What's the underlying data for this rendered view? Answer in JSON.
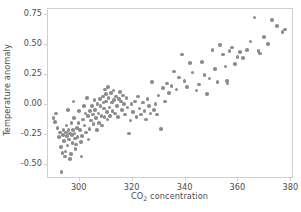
{
  "chart_data": {
    "type": "scatter",
    "title": "",
    "xlabel": "CO2 concentration",
    "xlabel_parts": {
      "pre": "CO",
      "sub": "2",
      "post": " concentration"
    },
    "ylabel": "Temperature anomaly",
    "xlim": [
      288,
      381
    ],
    "ylim": [
      -0.62,
      0.8
    ],
    "grid": false,
    "legend": null,
    "marker_color": "#8c8c8c",
    "marker_size_px": 3.6,
    "frame_color": "#cfcfcf",
    "tick_label_color": "#4d4d4d",
    "xticks": [
      300,
      320,
      340,
      360,
      380
    ],
    "xtick_labels": [
      "300",
      "320",
      "340",
      "360",
      "380"
    ],
    "yticks": [
      0.75,
      0.5,
      0.25,
      0.0,
      -0.25,
      -0.5
    ],
    "ytick_labels": [
      "0.75",
      "0.50",
      "0.25",
      "0.00",
      "-0.25",
      "-0.50"
    ],
    "series": [
      {
        "name": "observations",
        "points": [
          [
            290.5,
            -0.12
          ],
          [
            291.0,
            -0.15
          ],
          [
            291.5,
            -0.08
          ],
          [
            292.0,
            -0.2
          ],
          [
            292.5,
            -0.28
          ],
          [
            293.0,
            -0.24
          ],
          [
            293.2,
            -0.36
          ],
          [
            293.5,
            -0.57
          ],
          [
            293.8,
            -0.41
          ],
          [
            294.0,
            -0.26
          ],
          [
            294.2,
            -0.22
          ],
          [
            294.5,
            -0.31
          ],
          [
            294.8,
            -0.44
          ],
          [
            295.0,
            -0.4
          ],
          [
            295.2,
            -0.24
          ],
          [
            295.4,
            -0.18
          ],
          [
            295.6,
            -0.27
          ],
          [
            295.8,
            -0.35
          ],
          [
            296.0,
            -0.05
          ],
          [
            296.2,
            -0.22
          ],
          [
            296.4,
            -0.3
          ],
          [
            296.6,
            -0.25
          ],
          [
            296.8,
            -0.46
          ],
          [
            297.0,
            -0.42
          ],
          [
            297.2,
            -0.16
          ],
          [
            297.4,
            -0.26
          ],
          [
            297.6,
            -0.33
          ],
          [
            297.8,
            -0.22
          ],
          [
            298.0,
            0.02
          ],
          [
            298.2,
            -0.12
          ],
          [
            298.4,
            -0.25
          ],
          [
            298.6,
            -0.29
          ],
          [
            298.8,
            -0.38
          ],
          [
            299.0,
            -0.34
          ],
          [
            299.3,
            -0.2
          ],
          [
            299.6,
            -0.28
          ],
          [
            299.9,
            -0.16
          ],
          [
            300.2,
            -0.06
          ],
          [
            300.5,
            -0.22
          ],
          [
            300.8,
            -0.32
          ],
          [
            301.0,
            -0.44
          ],
          [
            301.3,
            -0.27
          ],
          [
            301.6,
            -0.13
          ],
          [
            301.9,
            -0.02
          ],
          [
            302.2,
            -0.18
          ],
          [
            302.5,
            -0.08
          ],
          [
            302.8,
            -0.24
          ],
          [
            303.1,
            0.05
          ],
          [
            303.4,
            -0.1
          ],
          [
            303.7,
            -0.3
          ],
          [
            304.0,
            -0.21
          ],
          [
            304.3,
            -0.06
          ],
          [
            304.6,
            -0.14
          ],
          [
            305.0,
            -0.02
          ],
          [
            305.3,
            -0.09
          ],
          [
            305.6,
            -0.17
          ],
          [
            305.9,
            0.03
          ],
          [
            306.2,
            -0.05
          ],
          [
            306.5,
            -0.12
          ],
          [
            306.8,
            -0.22
          ],
          [
            307.1,
            0.0
          ],
          [
            307.4,
            -0.08
          ],
          [
            307.7,
            -0.16
          ],
          [
            308.0,
            0.04
          ],
          [
            308.3,
            -0.02
          ],
          [
            308.6,
            -0.1
          ],
          [
            308.9,
            -0.18
          ],
          [
            309.2,
            0.06
          ],
          [
            309.4,
            0.01
          ],
          [
            309.6,
            -0.04
          ],
          [
            309.8,
            -0.11
          ],
          [
            310.0,
            0.12
          ],
          [
            310.2,
            0.08
          ],
          [
            310.4,
            0.02
          ],
          [
            310.6,
            -0.07
          ],
          [
            310.8,
            -0.13
          ],
          [
            311.0,
            0.14
          ],
          [
            311.3,
            0.05
          ],
          [
            311.6,
            -0.03
          ],
          [
            311.9,
            -0.1
          ],
          [
            312.2,
            0.09
          ],
          [
            312.5,
            0.01
          ],
          [
            312.8,
            -0.06
          ],
          [
            313.1,
            0.11
          ],
          [
            313.4,
            0.03
          ],
          [
            313.7,
            -0.08
          ],
          [
            314.0,
            0.06
          ],
          [
            314.4,
            -0.02
          ],
          [
            314.8,
            -0.11
          ],
          [
            315.2,
            0.04
          ],
          [
            315.6,
            0.1
          ],
          [
            316.0,
            0.02
          ],
          [
            316.4,
            -0.05
          ],
          [
            316.8,
            0.07
          ],
          [
            317.2,
            0.0
          ],
          [
            317.6,
            -0.09
          ],
          [
            318.0,
            0.05
          ],
          [
            318.5,
            -0.03
          ],
          [
            319.0,
            -0.25
          ],
          [
            319.5,
            -0.14
          ],
          [
            320.0,
            0.0
          ],
          [
            320.6,
            -0.07
          ],
          [
            321.2,
            0.02
          ],
          [
            321.8,
            -0.11
          ],
          [
            322.4,
            0.06
          ],
          [
            323.0,
            -0.04
          ],
          [
            323.6,
            -0.09
          ],
          [
            324.2,
            0.01
          ],
          [
            324.8,
            -0.06
          ],
          [
            325.4,
            -0.13
          ],
          [
            326.0,
            0.04
          ],
          [
            326.6,
            -0.02
          ],
          [
            327.2,
            -0.08
          ],
          [
            327.8,
            0.18
          ],
          [
            328.4,
            -0.05
          ],
          [
            329.0,
            0.0
          ],
          [
            329.6,
            -0.09
          ],
          [
            330.2,
            0.07
          ],
          [
            331.0,
            -0.21
          ],
          [
            331.8,
            0.13
          ],
          [
            332.6,
            0.02
          ],
          [
            333.4,
            0.17
          ],
          [
            334.2,
            0.09
          ],
          [
            335.0,
            0.15
          ],
          [
            336.0,
            0.27
          ],
          [
            337.0,
            0.12
          ],
          [
            338.0,
            0.22
          ],
          [
            339.0,
            0.41
          ],
          [
            340.0,
            0.19
          ],
          [
            341.0,
            0.14
          ],
          [
            342.0,
            0.34
          ],
          [
            343.0,
            0.26
          ],
          [
            344.5,
            0.11
          ],
          [
            345.5,
            0.16
          ],
          [
            346.5,
            0.35
          ],
          [
            347.5,
            0.24
          ],
          [
            348.5,
            0.08
          ],
          [
            349.5,
            0.21
          ],
          [
            350.5,
            0.45
          ],
          [
            351.5,
            0.29
          ],
          [
            352.5,
            0.18
          ],
          [
            353.5,
            0.49
          ],
          [
            354.5,
            0.41
          ],
          [
            355.5,
            0.31
          ],
          [
            356.0,
            0.19
          ],
          [
            356.3,
            0.17
          ],
          [
            357.0,
            0.44
          ],
          [
            358.0,
            0.47
          ],
          [
            359.0,
            0.33
          ],
          [
            360.0,
            0.39
          ],
          [
            361.0,
            0.43
          ],
          [
            362.0,
            0.38
          ],
          [
            363.5,
            0.45
          ],
          [
            365.0,
            0.52
          ],
          [
            366.5,
            0.72
          ],
          [
            368.0,
            0.44
          ],
          [
            368.5,
            0.42
          ],
          [
            370.0,
            0.56
          ],
          [
            371.5,
            0.5
          ],
          [
            373.0,
            0.7
          ],
          [
            375.0,
            0.65
          ],
          [
            377.0,
            0.6
          ],
          [
            378.0,
            0.62
          ]
        ]
      }
    ]
  }
}
